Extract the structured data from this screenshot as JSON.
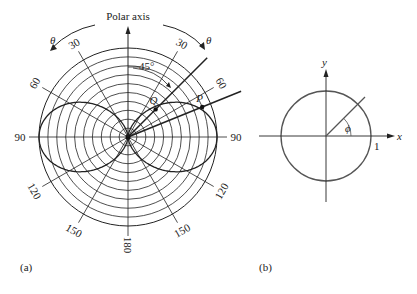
{
  "figure_a": {
    "caption": "(a)",
    "polar_axis_label": "Polar axis",
    "theta_symbol": "θ",
    "angle_marker": "45°",
    "point_labels": {
      "Q": "Q",
      "P": "P"
    },
    "center": [
      128,
      137
    ],
    "outer_radius": 89,
    "ring_count": 10,
    "angle_ticks": [
      {
        "deg": -150,
        "label": "150"
      },
      {
        "deg": -120,
        "label": "120"
      },
      {
        "deg": -90,
        "label": "90"
      },
      {
        "deg": -60,
        "label": "60"
      },
      {
        "deg": -30,
        "label": "30"
      },
      {
        "deg": 30,
        "label": "30"
      },
      {
        "deg": 60,
        "label": "60"
      },
      {
        "deg": 90,
        "label": "90"
      },
      {
        "deg": 120,
        "label": "120"
      },
      {
        "deg": 150,
        "label": "150"
      },
      {
        "deg": 180,
        "label": "180"
      }
    ],
    "rays": [
      {
        "deg": 45,
        "length": 112,
        "point": "Q",
        "point_r": 39
      },
      {
        "deg": 68,
        "length": 122,
        "point": "P",
        "point_r": 80
      }
    ]
  },
  "figure_b": {
    "caption": "(b)",
    "x_label": "x",
    "y_label": "y",
    "phi_label": "ϕ",
    "unit_label": "1",
    "center": [
      326,
      136
    ],
    "radius": 45,
    "ray_deg": 45
  },
  "colors": {
    "line": "#222222",
    "circle_b": "#555555"
  }
}
